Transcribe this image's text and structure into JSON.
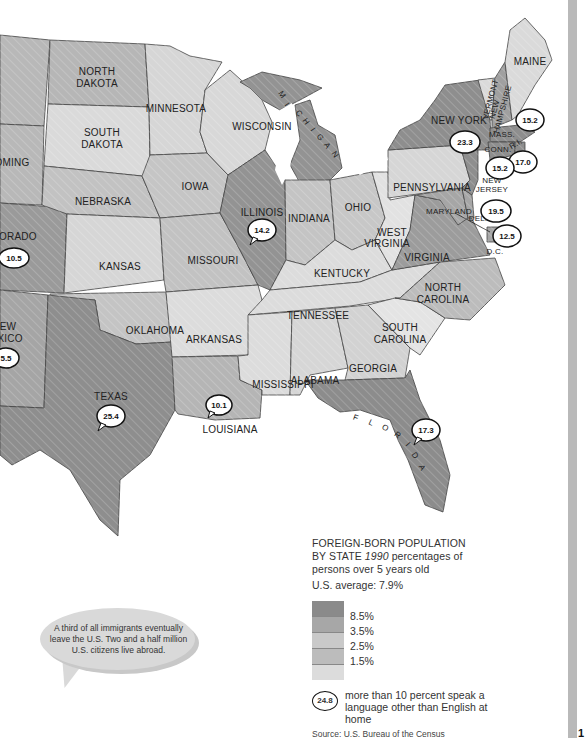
{
  "legend": {
    "title_line1": "FOREIGN-BORN POPULATION",
    "title_line2_prefix": "BY STATE ",
    "title_year": "1990",
    "title_line2_suffix": " percentages of",
    "title_line3": "persons over 5 years old",
    "us_average": "U.S. average: 7.9%",
    "breaks": [
      "8.5%",
      "3.5%",
      "2.5%",
      "1.5%"
    ],
    "colors": [
      "#8a8a8a",
      "#a7a7a7",
      "#c9c9c9",
      "#bcbcbc",
      "#dcdcdc"
    ],
    "bubble_example_value": "24.8",
    "bubble_note": "more than 10 percent speak a language other than English at home",
    "source": "Source: U.S. Bureau of the Census"
  },
  "quote": {
    "text": "A third of all immigrants eventually leave the U.S. Two and a half million U.S. citizens live abroad."
  },
  "page_number": "1",
  "states": {
    "wyoming": "OMING",
    "colorado": "LORADO",
    "new_mexico_1": "EW",
    "new_mexico_2": "XICO",
    "north_dakota_1": "NORTH",
    "north_dakota_2": "DAKOTA",
    "south_dakota_1": "SOUTH",
    "south_dakota_2": "DAKOTA",
    "nebraska": "NEBRASKA",
    "kansas": "KANSAS",
    "oklahoma": "OKLAHOMA",
    "texas": "TEXAS",
    "minnesota": "MINNESOTA",
    "iowa": "IOWA",
    "missouri": "MISSOURI",
    "arkansas": "ARKANSAS",
    "louisiana": "LOUISIANA",
    "wisconsin": "WISCONSIN",
    "illinois": "ILLINOIS",
    "michigan": [
      "M",
      "I",
      "C",
      "H",
      "I",
      "G",
      "A",
      "N"
    ],
    "indiana": "INDIANA",
    "ohio": "OHIO",
    "kentucky": "KENTUCKY",
    "tennessee": "TENNESSEE",
    "mississippi": "MISSISSIPPI",
    "alabama": "ALABAMA",
    "georgia": "GEORGIA",
    "florida": [
      "F",
      "L",
      "O",
      "R",
      "I",
      "D",
      "A"
    ],
    "south_carolina_1": "SOUTH",
    "south_carolina_2": "CAROLINA",
    "north_carolina_1": "NORTH",
    "north_carolina_2": "CAROLINA",
    "virginia": "VIRGINIA",
    "west_virginia_1": "WEST",
    "west_virginia_2": "VIRGINIA",
    "pennsylvania": "PENNSYLVANIA",
    "new_york": "NEW YORK",
    "vermont": "VERMONT",
    "new_hampshire_1": "NEW",
    "new_hampshire_2": "HAMPSHIRE",
    "maine": "MAINE",
    "massachusetts": "MASS.",
    "connecticut": "CONN.",
    "rhode_island": "R.I.",
    "new_jersey_1": "NEW",
    "new_jersey_2": "JERSEY",
    "maryland": "MARYLAND",
    "delaware": "DEL.",
    "dc": "D.C."
  },
  "bubbles": {
    "colorado": "10.5",
    "new_mexico": "5.5",
    "texas": "25.4",
    "illinois": "14.2",
    "louisiana": "10.1",
    "florida": "17.3",
    "new_york": "23.3",
    "massachusetts": "15.2",
    "rhode_island": "17.0",
    "connecticut": "15.2",
    "new_jersey": "19.5",
    "dc": "12.5"
  }
}
